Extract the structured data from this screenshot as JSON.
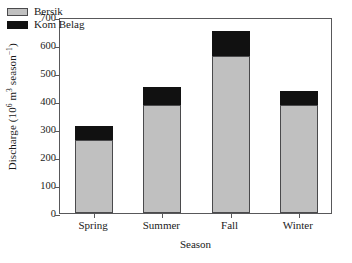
{
  "chart_data": {
    "type": "bar",
    "subtype": "stacked-bar",
    "title": "",
    "xlabel": "Season",
    "ylabel": "Discharge (10^6 m^3 season^-1)",
    "ylabel_parts": {
      "prefix": "Discharge (10",
      "sup1": "6",
      "mid": " m",
      "sup2": "3",
      "suffix": " season",
      "sup3": "−1",
      "end": ")"
    },
    "categories": [
      "Spring",
      "Summer",
      "Fall",
      "Winter"
    ],
    "series": [
      {
        "name": "Bersik",
        "color": "#c0c0c0",
        "values": [
          260,
          385,
          560,
          385
        ]
      },
      {
        "name": "Kom Belag",
        "color": "#111111",
        "values": [
          50,
          65,
          90,
          52
        ]
      }
    ],
    "totals": [
      310,
      450,
      650,
      437
    ],
    "ylim": [
      0,
      700
    ],
    "yticks": [
      0,
      100,
      200,
      300,
      400,
      500,
      600,
      700
    ],
    "ytick_labels": [
      "0",
      "100",
      "200",
      "300",
      "400",
      "500",
      "600",
      "700"
    ],
    "grid": false,
    "legend_position": "top-left",
    "legend": [
      "Bersik",
      "Kom Belag"
    ],
    "frame": true,
    "tick_direction": "out"
  }
}
